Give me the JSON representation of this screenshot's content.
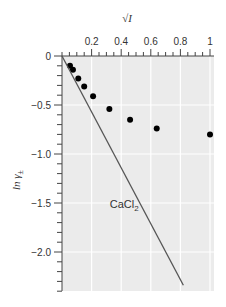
{
  "chart_data": {
    "type": "scatter",
    "title": "",
    "xlabel": "√I",
    "ylabel": "ln γ±",
    "xlim": [
      0,
      1
    ],
    "ylim": [
      -2.4,
      0
    ],
    "x_axis_position": "top",
    "grid": true,
    "x_ticks": [
      0.2,
      0.4,
      0.6,
      0.8,
      1
    ],
    "x_tick_labels": [
      "0.2",
      "0.4",
      "0.6",
      "0.8",
      "1"
    ],
    "x_minor_step": 0.05,
    "y_ticks": [
      0,
      -0.5,
      -1.0,
      -1.5,
      -2.0
    ],
    "y_tick_labels": [
      "0",
      "−0.5",
      "−1.0",
      "−1.5",
      "−2.0"
    ],
    "y_minor_step": 0.1,
    "series": [
      {
        "name": "CaCl2 measured",
        "kind": "scatter",
        "x": [
          0.054,
          0.074,
          0.11,
          0.15,
          0.21,
          0.32,
          0.46,
          0.64,
          1.0
        ],
        "y": [
          -0.1,
          -0.14,
          -0.23,
          -0.31,
          -0.41,
          -0.54,
          -0.65,
          -0.74,
          -0.8
        ],
        "color": "#000000"
      },
      {
        "name": "Debye-Hückel limiting law",
        "kind": "line",
        "x": [
          0,
          0.82
        ],
        "y": [
          0,
          -2.34
        ],
        "color": "#555555"
      }
    ],
    "annotations": [
      {
        "text_main": "CaCl",
        "text_sub": "2",
        "x": 0.42,
        "y": -1.55
      }
    ],
    "colors": {
      "plot_background": "#ebebeb",
      "grid": "#ffffff",
      "axis": "#444444"
    }
  }
}
